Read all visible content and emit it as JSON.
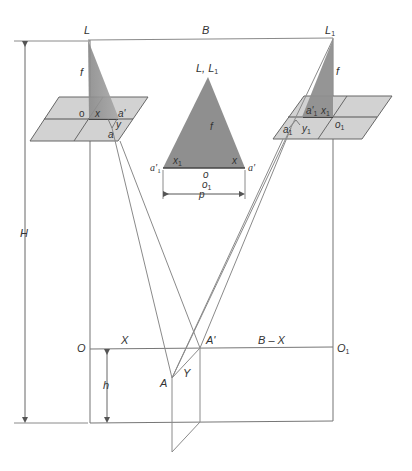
{
  "diagram": {
    "labels": {
      "L": "L",
      "L1": "L",
      "L1_sub": "1",
      "B": "B",
      "H": "H",
      "f_left": "f",
      "f_right": "f",
      "f_center": "f",
      "center_top": "L, L",
      "center_top_sub": "1",
      "o_left": "o",
      "x_left": "x",
      "a_prime_left": "a'",
      "y_left": "y",
      "a_left": "a",
      "a1_prime_right": "a'",
      "a1_prime_right_sub": "1",
      "x1_right": "x",
      "x1_right_sub": "1",
      "o1_right": "o",
      "o1_right_sub": "1",
      "a1_right": "a",
      "a1_right_sub": "1",
      "y1_right": "y",
      "y1_right_sub": "1",
      "a1_center": "a'",
      "a1_center_sub": "1",
      "x1_center": "x",
      "x1_center_sub": "1",
      "x_center": "x",
      "a_prime_center": "a'",
      "o_center": "o",
      "o1_center": "o",
      "o1_center_sub": "1",
      "p": "p",
      "O": "O",
      "X": "X",
      "A_prime": "A'",
      "B_minus_X": "B – X",
      "O1": "O",
      "O1_sub": "1",
      "h": "h",
      "A": "A",
      "Y": "Y"
    },
    "colors": {
      "line": "#8a8a8a",
      "dark_line": "#555555",
      "plane_fill": "#cfcfcf",
      "triangle_fill": "#8f8f8f",
      "text": "#333333"
    }
  }
}
